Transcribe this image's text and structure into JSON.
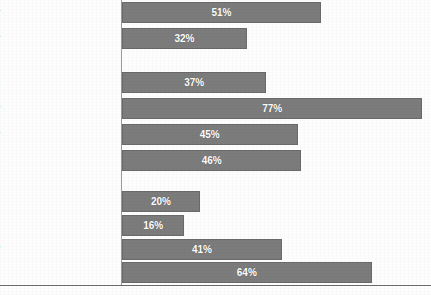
{
  "chart_data": {
    "type": "bar",
    "orientation": "horizontal",
    "title": "",
    "subtitle": "",
    "xlabel": "",
    "ylabel": "",
    "xlim": [
      0,
      79
    ],
    "grid": false,
    "legend": null,
    "value_suffix": "%",
    "categories": [
      "Poor",
      "Near Poor",
      "All Children",
      "Children Below Poverty",
      "Parents Below Poverty",
      "Births (Pregnant Women)",
      "Medicare Beneficiaries",
      "Disabled Adults",
      "Adults with HIV",
      "Nursing Home Residents"
    ],
    "values": [
      51,
      32,
      37,
      77,
      45,
      46,
      20,
      16,
      41,
      64
    ],
    "value_labels": [
      "51%",
      "32%",
      "37%",
      "77%",
      "45%",
      "46%",
      "20%",
      "16%",
      "41%",
      "64%"
    ],
    "groups": [
      {
        "name": "income-group",
        "indices": [
          0,
          1
        ]
      },
      {
        "name": "family-group",
        "indices": [
          2,
          3,
          4,
          5
        ]
      },
      {
        "name": "special-populations-group",
        "indices": [
          6,
          7,
          8,
          9
        ]
      }
    ],
    "bars": [
      {
        "label": "Poor",
        "value": 51,
        "value_label": "51%",
        "top": 2,
        "group": 0
      },
      {
        "label": "Near Poor",
        "value": 32,
        "value_label": "32%",
        "top": 28,
        "group": 0
      },
      {
        "label": "All Children",
        "value": 37,
        "value_label": "37%",
        "top": 72,
        "group": 1
      },
      {
        "label": "Children Below Poverty",
        "value": 77,
        "value_label": "77%",
        "top": 98,
        "group": 1
      },
      {
        "label": "Parents Below Poverty",
        "value": 45,
        "value_label": "45%",
        "top": 124,
        "group": 1
      },
      {
        "label": "Births (Pregnant Women)",
        "value": 46,
        "value_label": "46%",
        "top": 150,
        "group": 1
      },
      {
        "label": "Medicare Beneficiaries",
        "value": 20,
        "value_label": "20%",
        "top": 191,
        "group": 2
      },
      {
        "label": "Disabled Adults",
        "value": 16,
        "value_label": "16%",
        "top": 215,
        "group": 2
      },
      {
        "label": "Adults with HIV",
        "value": 41,
        "value_label": "41%",
        "top": 239,
        "group": 2
      },
      {
        "label": "Nursing Home Residents",
        "value": 64,
        "value_label": "64%",
        "top": 262,
        "group": 2
      }
    ]
  },
  "style": {
    "bar_fill": "#7c7c7c",
    "bar_border": "#6a6a6a",
    "value_text": "#ffffff",
    "label_text": "#2b2b2b",
    "axis_line": "#9a9a9a",
    "baseline": "#6d6d6d",
    "background": "#fdfdfd"
  }
}
